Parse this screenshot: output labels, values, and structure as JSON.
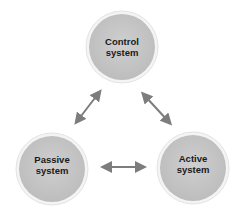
{
  "diagram": {
    "type": "cycle",
    "nodes": [
      {
        "id": "control",
        "line1": "Control",
        "line2": "system"
      },
      {
        "id": "passive",
        "line1": "Passive",
        "line2": "system"
      },
      {
        "id": "active",
        "line1": "Active",
        "line2": "system"
      }
    ],
    "edges": [
      {
        "from": "control",
        "to": "passive",
        "bidirectional": true
      },
      {
        "from": "control",
        "to": "active",
        "bidirectional": true
      },
      {
        "from": "passive",
        "to": "active",
        "bidirectional": true
      }
    ],
    "colors": {
      "node_fill": "#c9c9c9",
      "node_rim": "#f4f4f4",
      "arrow": "#7d7d7d",
      "text": "#1a1a1a"
    }
  }
}
